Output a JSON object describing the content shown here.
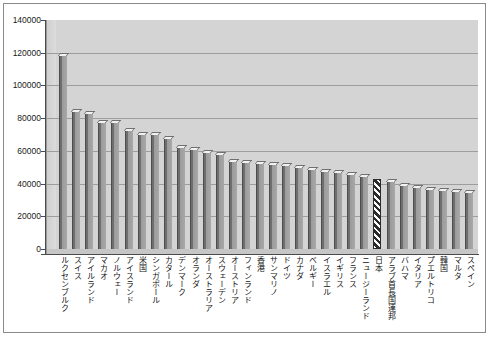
{
  "chart_data": {
    "type": "bar",
    "title": "",
    "subtitle": "",
    "xlabel": "",
    "ylabel": "",
    "ylim": [
      0,
      140000
    ],
    "ytick_labels": [
      "140000",
      "120000",
      "100000",
      "80000",
      "60000",
      "40000",
      "20000",
      "0"
    ],
    "ytick_values": [
      140000,
      120000,
      100000,
      80000,
      60000,
      40000,
      20000,
      0
    ],
    "grid": true,
    "legend": "none",
    "highlight_category": "日本",
    "highlight_style": "diagonal-hatch",
    "categories": [
      "ルクセンブルク",
      "スイス",
      "アイルランド",
      "マカオ",
      "ノルウェー",
      "アイスランド",
      "米国",
      "シンガポール",
      "カタール",
      "デンマーク",
      "オランダ",
      "オーストラリア",
      "スウェーデン",
      "オーストリア",
      "フィンランド",
      "香港",
      "サンマリノ",
      "ドイツ",
      "カナダ",
      "ベルギー",
      "イスラエル",
      "イギリス",
      "フランス",
      "ニュージーランド",
      "日本",
      "アラブ首長国連邦",
      "バハマ",
      "イタリア",
      "プエルトリコ",
      "韓国",
      "マルタ",
      "スペイン"
    ],
    "values": [
      118000,
      84000,
      82500,
      77000,
      77000,
      72000,
      70000,
      69500,
      67500,
      62000,
      60500,
      58500,
      57500,
      53500,
      52500,
      52000,
      51500,
      50500,
      49500,
      48500,
      47000,
      46500,
      45500,
      44000,
      42500,
      41000,
      38500,
      37000,
      36000,
      35500,
      35000,
      34500
    ],
    "colors": {
      "plot_background": "#d4d4d4",
      "bar_fill": "#8d8d8d",
      "bar_shadow": "#6e6e6e",
      "axis": "#4a4a4a",
      "gridline": "#9d9d9d",
      "highlight_fill": "#2b2b2b",
      "frame": "#8a8a8a",
      "page_background": "#ffffff",
      "text": "#111111"
    }
  }
}
